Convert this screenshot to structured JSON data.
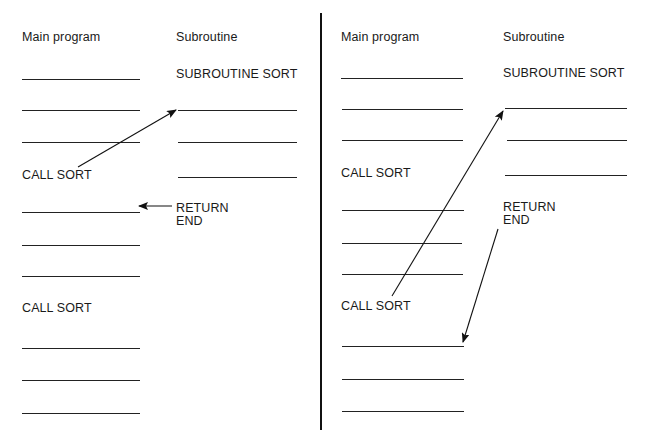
{
  "diagram": {
    "colors": {
      "ink": "#1a1a1a",
      "background": "#ffffff"
    },
    "panels": [
      {
        "id": "left",
        "main_header": "Main program",
        "sub_header": "Subroutine",
        "main_items": [
          {
            "type": "line"
          },
          {
            "type": "line"
          },
          {
            "type": "line"
          },
          {
            "type": "text",
            "label": "CALL SORT"
          },
          {
            "type": "line"
          },
          {
            "type": "line"
          },
          {
            "type": "line"
          },
          {
            "type": "text",
            "label": "CALL SORT"
          },
          {
            "type": "line"
          },
          {
            "type": "line"
          },
          {
            "type": "line"
          }
        ],
        "sub_title": "SUBROUTINE SORT",
        "sub_return": "RETURN",
        "sub_end": "END",
        "arrows": [
          {
            "from": "CALL SORT (1st)",
            "to": "first subroutine statement"
          },
          {
            "from": "RETURN",
            "to": "statement after 1st CALL SORT"
          }
        ]
      },
      {
        "id": "right",
        "main_header": "Main program",
        "sub_header": "Subroutine",
        "main_items": [
          {
            "type": "line"
          },
          {
            "type": "line"
          },
          {
            "type": "line"
          },
          {
            "type": "text",
            "label": "CALL SORT"
          },
          {
            "type": "line"
          },
          {
            "type": "line"
          },
          {
            "type": "line"
          },
          {
            "type": "text",
            "label": "CALL SORT"
          },
          {
            "type": "line"
          },
          {
            "type": "line"
          },
          {
            "type": "line"
          }
        ],
        "sub_title": "SUBROUTINE SORT",
        "sub_return": "RETURN",
        "sub_end": "END",
        "arrows": [
          {
            "from": "CALL SORT (2nd)",
            "to": "first subroutine statement"
          },
          {
            "from": "RETURN",
            "to": "statement after 2nd CALL SORT"
          }
        ]
      }
    ]
  }
}
